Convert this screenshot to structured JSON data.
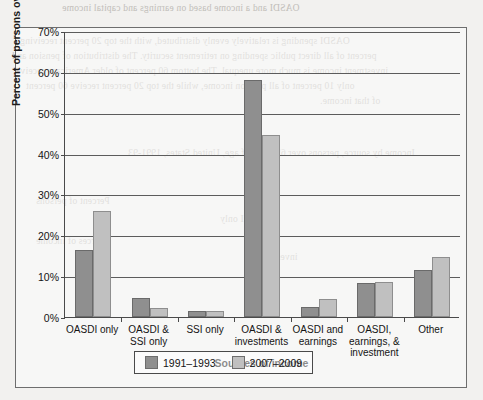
{
  "chart_data": {
    "type": "bar",
    "title": "",
    "xlabel": "Sources of income",
    "ylabel": "Percent of persons over 65 years of age",
    "ylim": [
      0,
      70
    ],
    "ytick_labels": [
      "0%",
      "10%",
      "20%",
      "30%",
      "40%",
      "50%",
      "60%",
      "70%"
    ],
    "ytick_values": [
      0,
      10,
      20,
      30,
      40,
      50,
      60,
      70
    ],
    "grid": true,
    "legend_position": "bottom",
    "categories": [
      "OASDI only",
      "OASDI &\nSSI only",
      "SSI only",
      "OASDI &\ninvestments",
      "OASDI and\nearnings",
      "OASDI,\nearnings, &\ninvestment",
      "Other"
    ],
    "series": [
      {
        "name": "1991–1993",
        "color": "#8f8f8f",
        "values": [
          16.4,
          4.6,
          1.4,
          58.0,
          2.5,
          8.3,
          11.5
        ]
      },
      {
        "name": "2007–2009",
        "color": "#c0c0c0",
        "values": [
          26.0,
          2.2,
          1.4,
          44.5,
          4.3,
          8.6,
          14.7
        ]
      }
    ]
  },
  "background_bleed": {
    "lines": [
      "OASDI and a income based on earnings and capital income",
      "OASDI spending is relatively evenly distributed, with the top 20 percent receiving",
      "percent of all direct public spending on retirement security. The distribution of pension and",
      "investment income is much more unequal. The bottom 60 percent of older Americans receive",
      "only 10 percent of all pension income, while the top 20 percent receive 60 percent",
      "of that income.",
      "Income by source, persons over 65 years of age, United States, 1991-93",
      "Sources of income",
      "Percent of persons",
      "OASDI only",
      "investments"
    ]
  }
}
